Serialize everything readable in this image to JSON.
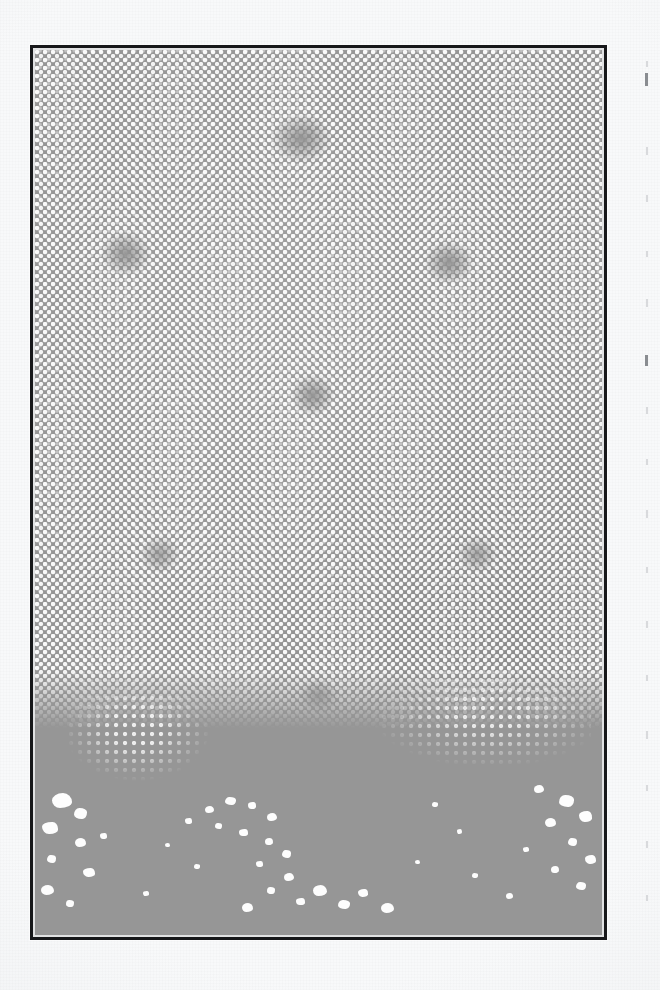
{
  "page": {
    "kind": "scanned-book-page",
    "background_color": "#f8f9fa",
    "width": 660,
    "height": 990,
    "caption": ""
  },
  "plate": {
    "name": "halftone-photographic-plate",
    "frame_color": "#17181a",
    "frame_width_px": 3,
    "inner_gap_color": "#eef0f1",
    "base_tone_color": "#969696",
    "dot_color": "#fdfdfd",
    "bounds": {
      "left": 30,
      "top": 45,
      "width": 577,
      "height": 895
    },
    "screen": {
      "type": "halftone-dot-screen",
      "pitch_px": 8,
      "dot_diameter_px": 4,
      "angle_deg": 45
    },
    "description": "Coarse halftone-screened photograph: white dots on mid-gray field, with scattered dark blotches and the screen dissolving into large white blow-out blobs across the bottom fifth."
  },
  "regions": [
    {
      "label": "dense-dot-field",
      "tone": "mid-gray"
    },
    {
      "label": "dark-blotch-top-center",
      "tone": "solid-dark"
    },
    {
      "label": "dark-blotch-upper-left",
      "tone": "solid-dark"
    },
    {
      "label": "dark-blotch-upper-right",
      "tone": "solid-dark"
    },
    {
      "label": "dark-blotch-center",
      "tone": "solid-dark"
    },
    {
      "label": "dissolving-screen-lower",
      "tone": "mixed"
    },
    {
      "label": "blow-out-blob-field-bottom",
      "tone": "white-on-gray"
    }
  ],
  "margin": {
    "name": "right-margin-show-through",
    "note": "faint vertical specks bleeding through from the reverse side of the sheet",
    "color": "#b9bcc0"
  }
}
